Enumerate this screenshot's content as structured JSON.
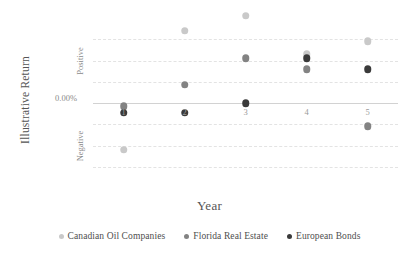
{
  "chart_data": {
    "type": "scatter",
    "title": "",
    "xlabel": "Year",
    "ylabel": "Illustrative Return",
    "x": [
      1,
      2,
      3,
      4,
      5
    ],
    "xtick_labels": [
      "1",
      "2",
      "3",
      "4",
      "5"
    ],
    "ytick_labels": [
      "Positive",
      "0.00%",
      "Negative"
    ],
    "ylim": [
      -4,
      4
    ],
    "xlim": [
      0.5,
      5.5
    ],
    "grid": true,
    "gridlines_y": [
      3,
      2,
      1,
      0,
      -1,
      -2,
      -3
    ],
    "zero_line": 0,
    "legend_position": "bottom",
    "series": [
      {
        "name": "Canadian Oil Companies",
        "color": "#c9c9c9",
        "points": [
          {
            "x": 1,
            "y": -2.2
          },
          {
            "x": 2,
            "y": 3.4
          },
          {
            "x": 3,
            "y": 4.1
          },
          {
            "x": 4,
            "y": 2.3
          },
          {
            "x": 5,
            "y": 2.9
          }
        ]
      },
      {
        "name": "Florida Real Estate",
        "color": "#838383",
        "points": [
          {
            "x": 1,
            "y": -0.15
          },
          {
            "x": 2,
            "y": 0.85
          },
          {
            "x": 3,
            "y": 2.1
          },
          {
            "x": 4,
            "y": 1.6
          },
          {
            "x": 5,
            "y": -1.1
          }
        ]
      },
      {
        "name": "European Bonds",
        "color": "#3a3a3a",
        "points": [
          {
            "x": 1,
            "y": -0.45
          },
          {
            "x": 2,
            "y": -0.45
          },
          {
            "x": 3,
            "y": 0.0
          },
          {
            "x": 4,
            "y": 2.1
          },
          {
            "x": 5,
            "y": 1.6
          }
        ]
      }
    ]
  },
  "axes": {
    "y_title": "Illustrative Return",
    "x_title": "Year",
    "y_tick_positive": "Positive",
    "y_tick_zero": "0.00%",
    "y_tick_negative": "Negative"
  },
  "legend": {
    "items": [
      {
        "label": "Canadian Oil Companies",
        "color": "#c9c9c9"
      },
      {
        "label": "Florida Real Estate",
        "color": "#838383"
      },
      {
        "label": "European Bonds",
        "color": "#3a3a3a"
      }
    ]
  }
}
